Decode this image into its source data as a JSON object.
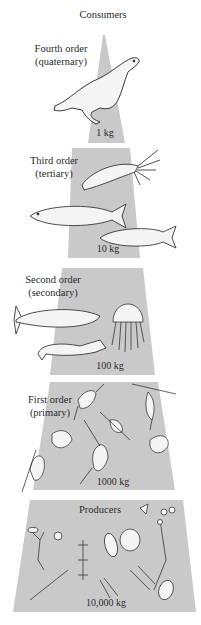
{
  "title": "Consumers",
  "colors": {
    "band": "#c9c9c9",
    "background": "#ffffff",
    "ink": "#2a2a2a"
  },
  "levels": [
    {
      "name": "Fourth order",
      "sub": "(quaternary)",
      "mass": "1 kg",
      "organisms": [
        "seal"
      ]
    },
    {
      "name": "Third order",
      "sub": "(tertiary)",
      "mass": "10 kg",
      "organisms": [
        "squid",
        "fish",
        "fish"
      ]
    },
    {
      "name": "Second order",
      "sub": "(secondary)",
      "mass": "100 kg",
      "organisms": [
        "trout",
        "jellyfish",
        "shrimp"
      ]
    },
    {
      "name": "First order",
      "sub": "(primary)",
      "mass": "1000 kg",
      "organisms": [
        "copepods",
        "zooplankton larvae"
      ]
    },
    {
      "name": "Producers",
      "sub": "",
      "mass": "10,000 kg",
      "organisms": [
        "diatoms",
        "phytoplankton"
      ]
    }
  ]
}
